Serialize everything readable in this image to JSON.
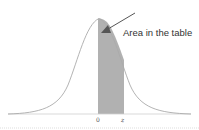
{
  "diagram": {
    "type": "normal-distribution",
    "annotation": "Area in the table",
    "ticks": [
      {
        "label": "0"
      },
      {
        "label": "z"
      }
    ],
    "colors": {
      "curve": "#aaaaaa",
      "shade": "#a9a9a9",
      "arrow": "#555555",
      "baseline": "#cccccc"
    }
  }
}
